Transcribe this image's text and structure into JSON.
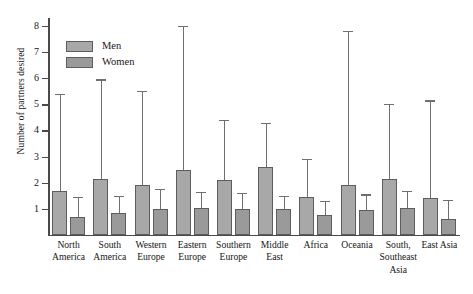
{
  "chart_data": {
    "type": "bar",
    "title": "",
    "xlabel": "",
    "ylabel": "Number of partners desired",
    "ylim": [
      0,
      8.3
    ],
    "yticks": [
      1,
      2,
      3,
      4,
      5,
      6,
      7,
      8
    ],
    "grid": false,
    "legend_position": "top-left",
    "categories": [
      "North\nAmerica",
      "South\nAmerica",
      "Western\nEurope",
      "Eastern\nEurope",
      "Southern\nEurope",
      "Middle\nEast",
      "Africa",
      "Oceania",
      "South,\nSoutheast\nAsia",
      "East Asia"
    ],
    "series": [
      {
        "name": "Men",
        "values": [
          1.7,
          2.15,
          1.9,
          2.5,
          2.1,
          2.6,
          1.45,
          1.9,
          2.15,
          1.4
        ],
        "error_upper": [
          5.4,
          5.95,
          5.5,
          8.0,
          4.4,
          4.3,
          2.9,
          7.8,
          5.0,
          5.15
        ]
      },
      {
        "name": "Women",
        "values": [
          0.7,
          0.85,
          1.0,
          1.05,
          1.0,
          1.0,
          0.75,
          0.95,
          1.05,
          0.6
        ],
        "error_upper": [
          1.45,
          1.5,
          1.75,
          1.65,
          1.6,
          1.5,
          1.3,
          1.55,
          1.7,
          1.35
        ]
      }
    ],
    "colors": {
      "men": "#a8a8a8",
      "women": "#9a9a9a",
      "axis": "#4a4a4a",
      "error": "#6f6f6f",
      "background": "#ffffff"
    },
    "legend": [
      "Men",
      "Women"
    ]
  }
}
